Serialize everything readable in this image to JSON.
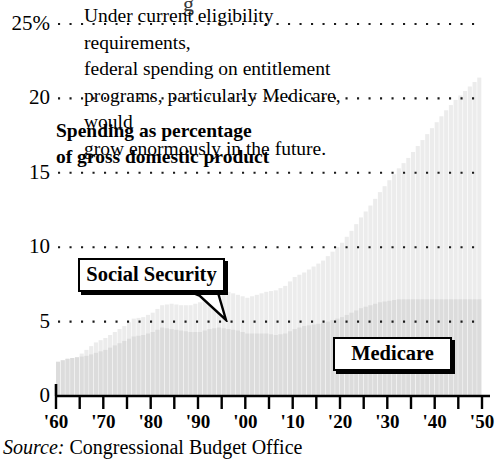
{
  "chart_data": {
    "type": "area",
    "title_line1": "Spending as percentage",
    "title_line2": "of gross domestic product",
    "xlabel": "",
    "ylabel": "",
    "ylim": [
      0,
      25
    ],
    "xlim": [
      1960,
      2050
    ],
    "grid": true,
    "grid_style": "dotted-horizontal",
    "legend_position": "inline-callouts",
    "ytick_labels": [
      "0",
      "5",
      "10",
      "15",
      "20",
      "25%"
    ],
    "ytick_values": [
      0,
      5,
      10,
      15,
      20,
      25
    ],
    "xtick_labels": [
      "'60",
      "'70",
      "'80",
      "'90",
      "'00",
      "'10",
      "'20",
      "'30",
      "'40",
      "'50"
    ],
    "xtick_values": [
      1960,
      1970,
      1980,
      1990,
      2000,
      2010,
      2020,
      2030,
      2040,
      2050
    ],
    "xtick_minor_values": [
      1965,
      1975,
      1985,
      1995,
      2005,
      2015,
      2025,
      2035,
      2045
    ],
    "x": [
      1960,
      1962,
      1964,
      1966,
      1968,
      1970,
      1972,
      1974,
      1976,
      1978,
      1980,
      1982,
      1984,
      1986,
      1988,
      1990,
      1992,
      1994,
      1996,
      1998,
      2000,
      2002,
      2004,
      2006,
      2008,
      2010,
      2012,
      2014,
      2016,
      2018,
      2020,
      2022,
      2024,
      2026,
      2028,
      2030,
      2032,
      2034,
      2036,
      2038,
      2040,
      2042,
      2044,
      2046,
      2048,
      2050
    ],
    "series": [
      {
        "name": "Social Security",
        "color": "#dcdcdc",
        "values": [
          2.3,
          2.5,
          2.6,
          2.7,
          2.9,
          3.1,
          3.4,
          3.7,
          4.0,
          4.1,
          4.3,
          4.6,
          4.5,
          4.4,
          4.3,
          4.3,
          4.5,
          4.6,
          4.5,
          4.4,
          4.2,
          4.2,
          4.2,
          4.1,
          4.2,
          4.5,
          4.7,
          4.8,
          4.9,
          5.1,
          5.3,
          5.6,
          5.9,
          6.1,
          6.3,
          6.4,
          6.5,
          6.5,
          6.5,
          6.5,
          6.5,
          6.5,
          6.5,
          6.5,
          6.5,
          6.5
        ]
      },
      {
        "name": "Medicare",
        "color": "#ececec",
        "values": [
          0.0,
          0.0,
          0.0,
          0.4,
          0.7,
          0.8,
          0.9,
          1.0,
          1.2,
          1.2,
          1.3,
          1.5,
          1.7,
          1.7,
          1.8,
          2.0,
          2.2,
          2.4,
          2.5,
          2.4,
          2.4,
          2.6,
          2.8,
          3.0,
          3.2,
          3.5,
          3.6,
          3.9,
          4.2,
          4.6,
          5.0,
          5.5,
          6.1,
          6.7,
          7.4,
          8.1,
          8.8,
          9.5,
          10.3,
          11.1,
          11.9,
          12.7,
          13.4,
          14.0,
          14.6,
          15.2
        ]
      }
    ],
    "annotation": {
      "text": "Under current eligibility requirements, federal spending on entitlement programs, particularly Medicare, would grow enormously in the future.",
      "lines": [
        "Under current eligibility requirements,",
        "federal spending on entitlement",
        "programs, particularly Medicare, would",
        "grow enormously in the future."
      ]
    },
    "callouts": [
      {
        "label": "Social Security",
        "has_pointer": true
      },
      {
        "label": "Medicare",
        "has_pointer": false
      }
    ],
    "source_keyword": "Source:",
    "source_text": "Congressional Budget Office"
  },
  "colors": {
    "background": "#ffffff",
    "ink": "#000000",
    "social_security_fill": "#dcdcdc",
    "medicare_fill": "#ececec",
    "gridline": "#1a1a1a"
  }
}
